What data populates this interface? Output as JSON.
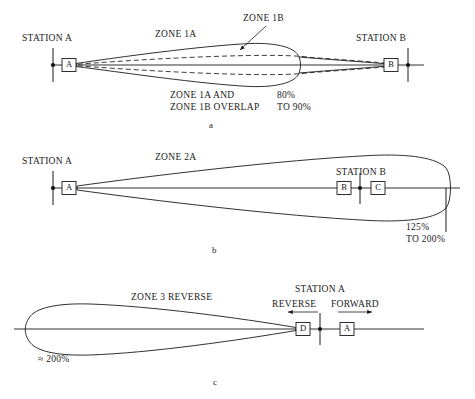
{
  "figure": {
    "panels": [
      {
        "caption": "a",
        "zone_label": "ZONE 1A",
        "inner_zone_label": "ZONE 1B",
        "station_left": "STATION A",
        "station_right": "STATION B",
        "box_left": "A",
        "box_right": "B",
        "note_line1": "ZONE 1A AND",
        "note_line2": "ZONE 1B OVERLAP",
        "pct_line1": "80%",
        "pct_line2": "TO 90%"
      },
      {
        "caption": "b",
        "zone_label": "ZONE 2A",
        "station_left": "STATION A",
        "station_right": "STATION B",
        "box_left": "A",
        "box_mid": "B",
        "box_right": "C",
        "pct_line1": "125%",
        "pct_line2": "TO 200%"
      },
      {
        "caption": "c",
        "zone_label": "ZONE 3 REVERSE",
        "station_right": "STATION A",
        "dir_reverse": "REVERSE",
        "dir_forward": "FORWARD",
        "box_left": "D",
        "box_right": "A",
        "pct_line1": "≈ 200%"
      }
    ],
    "colors": {
      "ink": "#1a1a1a",
      "paper": "#ffffff"
    }
  }
}
